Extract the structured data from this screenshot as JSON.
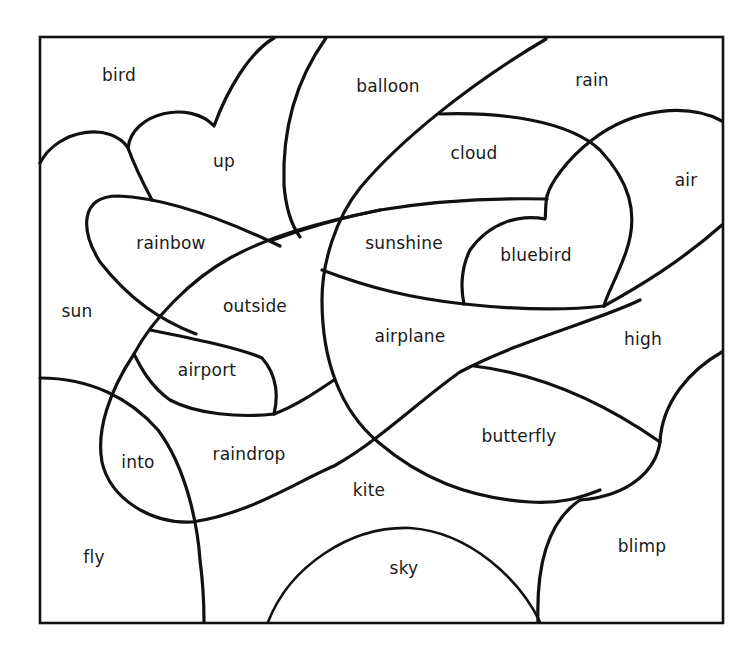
{
  "worksheet": {
    "frame": {
      "x": 40,
      "y": 37,
      "width": 683,
      "height": 586
    },
    "line_color": "#111111",
    "background": "#ffffff",
    "regions": [
      {
        "id": "bird",
        "label": "bird",
        "x": 119,
        "y": 75
      },
      {
        "id": "up",
        "label": "up",
        "x": 224,
        "y": 161
      },
      {
        "id": "balloon",
        "label": "balloon",
        "x": 388,
        "y": 86
      },
      {
        "id": "rain",
        "label": "rain",
        "x": 592,
        "y": 80
      },
      {
        "id": "cloud",
        "label": "cloud",
        "x": 474,
        "y": 153
      },
      {
        "id": "air",
        "label": "air",
        "x": 686,
        "y": 180
      },
      {
        "id": "rainbow",
        "label": "rainbow",
        "x": 171,
        "y": 243
      },
      {
        "id": "sunshine",
        "label": "sunshine",
        "x": 404,
        "y": 243
      },
      {
        "id": "bluebird",
        "label": "bluebird",
        "x": 536,
        "y": 255
      },
      {
        "id": "sun",
        "label": "sun",
        "x": 77,
        "y": 311
      },
      {
        "id": "outside",
        "label": "outside",
        "x": 255,
        "y": 306
      },
      {
        "id": "airplane",
        "label": "airplane",
        "x": 410,
        "y": 336
      },
      {
        "id": "high",
        "label": "high",
        "x": 643,
        "y": 339
      },
      {
        "id": "airport",
        "label": "airport",
        "x": 207,
        "y": 370
      },
      {
        "id": "into",
        "label": "into",
        "x": 138,
        "y": 462
      },
      {
        "id": "raindrop",
        "label": "raindrop",
        "x": 249,
        "y": 454
      },
      {
        "id": "butterfly",
        "label": "butterfly",
        "x": 519,
        "y": 436
      },
      {
        "id": "kite",
        "label": "kite",
        "x": 369,
        "y": 490
      },
      {
        "id": "fly",
        "label": "fly",
        "x": 94,
        "y": 557
      },
      {
        "id": "sky",
        "label": "sky",
        "x": 404,
        "y": 568
      },
      {
        "id": "blimp",
        "label": "blimp",
        "x": 642,
        "y": 546
      }
    ]
  }
}
